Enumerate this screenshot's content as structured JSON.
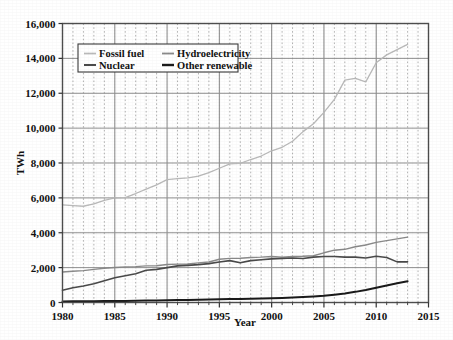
{
  "chart_data": {
    "type": "line",
    "title": "",
    "xlabel": "Year",
    "ylabel": "TWh",
    "xlim": [
      1980,
      2015
    ],
    "ylim": [
      0,
      16000
    ],
    "grid": true,
    "legend_position": "top-left-inside",
    "xticks": [
      "1980",
      "1985",
      "1990",
      "1995",
      "2000",
      "2005",
      "2010",
      "2015"
    ],
    "xtick_values": [
      1980,
      1985,
      1990,
      1995,
      2000,
      2005,
      2010,
      2015
    ],
    "yticks": [
      "0",
      "2,000",
      "4,000",
      "6,000",
      "8,000",
      "10,000",
      "12,000",
      "14,000",
      "16,000"
    ],
    "ytick_values": [
      0,
      2000,
      4000,
      6000,
      8000,
      10000,
      12000,
      14000,
      16000
    ],
    "minor_xtick_step": 1,
    "x": [
      1980,
      1981,
      1982,
      1983,
      1984,
      1985,
      1986,
      1987,
      1988,
      1989,
      1990,
      1991,
      1992,
      1993,
      1994,
      1995,
      1996,
      1997,
      1998,
      1999,
      2000,
      2001,
      2002,
      2003,
      2004,
      2005,
      2006,
      2007,
      2008,
      2009,
      2010,
      2011,
      2012,
      2013
    ],
    "series": [
      {
        "name": "Fossil fuel",
        "color": "#b9b9b9",
        "width": 1.3,
        "values": [
          5600,
          5560,
          5520,
          5650,
          5850,
          6000,
          6020,
          6250,
          6500,
          6750,
          7050,
          7100,
          7150,
          7250,
          7450,
          7700,
          7950,
          7980,
          8200,
          8400,
          8700,
          8900,
          9250,
          9800,
          10250,
          10900,
          11650,
          12750,
          12850,
          12650,
          13750,
          14200,
          14500,
          14800
        ]
      },
      {
        "name": "Hydroelectricity",
        "color": "#8a8a8a",
        "width": 1.4,
        "values": [
          1750,
          1790,
          1830,
          1900,
          1960,
          2010,
          2040,
          2060,
          2100,
          2110,
          2180,
          2200,
          2210,
          2270,
          2320,
          2480,
          2530,
          2540,
          2580,
          2600,
          2640,
          2600,
          2640,
          2650,
          2680,
          2850,
          3000,
          3050,
          3200,
          3300,
          3450,
          3550,
          3650,
          3750
        ]
      },
      {
        "name": "Nuclear",
        "color": "#4a4a4a",
        "width": 1.6,
        "values": [
          700,
          850,
          950,
          1070,
          1250,
          1420,
          1530,
          1650,
          1850,
          1900,
          2000,
          2100,
          2130,
          2170,
          2230,
          2320,
          2400,
          2280,
          2400,
          2450,
          2500,
          2530,
          2550,
          2520,
          2600,
          2640,
          2640,
          2600,
          2600,
          2550,
          2650,
          2580,
          2330,
          2330
        ]
      },
      {
        "name": "Other renewable",
        "color": "#1a1a1a",
        "width": 2.0,
        "values": [
          60,
          65,
          70,
          75,
          80,
          85,
          90,
          100,
          110,
          120,
          130,
          140,
          150,
          160,
          170,
          180,
          195,
          205,
          215,
          230,
          250,
          265,
          285,
          310,
          345,
          390,
          450,
          520,
          610,
          720,
          850,
          980,
          1100,
          1220
        ]
      }
    ],
    "legend": [
      {
        "label": "Fossil fuel",
        "color": "#b9b9b9",
        "width": 1.3
      },
      {
        "label": "Hydroelectricity",
        "color": "#8a8a8a",
        "width": 1.4
      },
      {
        "label": "Nuclear",
        "color": "#4a4a4a",
        "width": 1.6
      },
      {
        "label": "Other renewable",
        "color": "#1a1a1a",
        "width": 2.0
      }
    ]
  },
  "axes": {
    "frame_color": "#4d4d4d",
    "major_grid_color": "#8f8f8f",
    "minor_grid_color": "#a8a8a8"
  }
}
